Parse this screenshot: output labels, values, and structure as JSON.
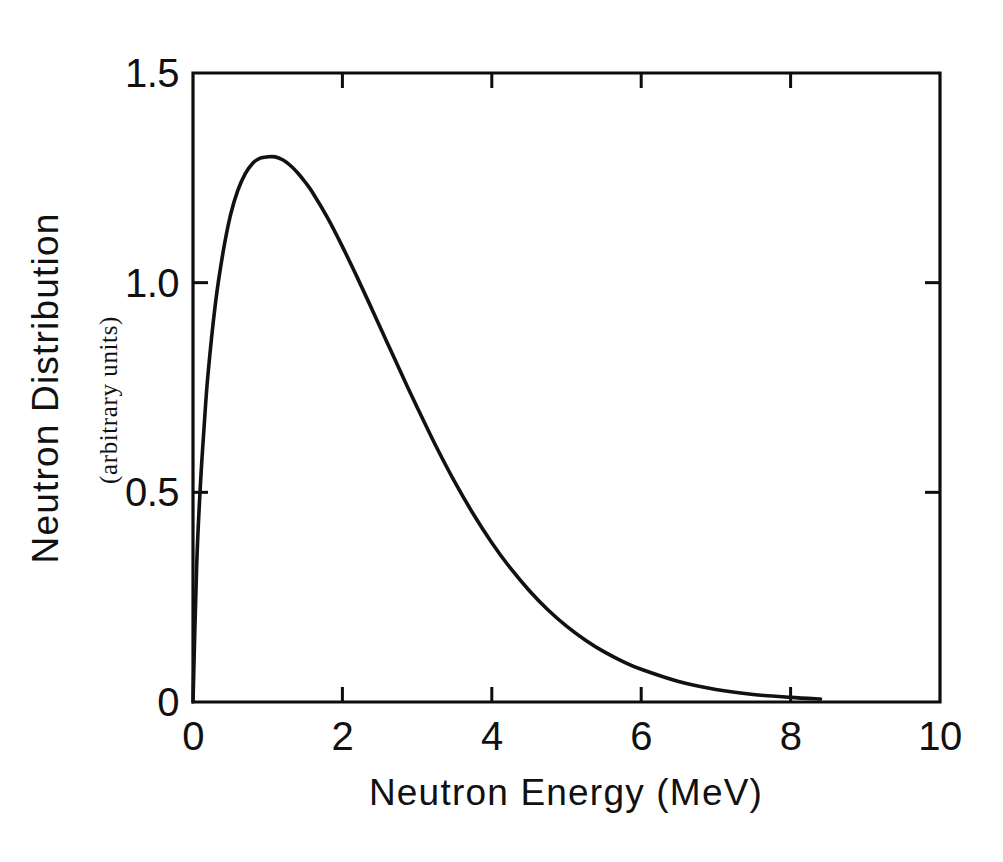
{
  "figure": {
    "background_color": "#ffffff",
    "ink_color": "#111111"
  },
  "chart_data": {
    "type": "line",
    "title": "",
    "xlabel": "Neutron Energy (MeV)",
    "ylabel": "Neutron Distribution",
    "ylabel_subtitle": "(arbitrary units)",
    "xlim": [
      0,
      10
    ],
    "ylim": [
      0,
      1.5
    ],
    "grid": false,
    "legend": null,
    "x_ticks": [
      0,
      2,
      4,
      6,
      8,
      10
    ],
    "x_tick_labels": [
      "0",
      "2",
      "4",
      "6",
      "8",
      "10"
    ],
    "y_ticks": [
      0,
      0.5,
      1.0,
      1.5
    ],
    "y_tick_labels": [
      "0",
      "0.5",
      "1.0",
      "1.5"
    ],
    "tick_direction": "in",
    "ticks_on_all_sides": true,
    "peak": {
      "x": 1.1,
      "y": 1.3
    },
    "series": [
      {
        "name": "Neutron distribution",
        "x": [
          0.0,
          0.05,
          0.1,
          0.15,
          0.2,
          0.3,
          0.4,
          0.5,
          0.6,
          0.7,
          0.8,
          0.9,
          1.0,
          1.1,
          1.2,
          1.3,
          1.4,
          1.5,
          1.6,
          1.8,
          2.0,
          2.2,
          2.4,
          2.6,
          2.8,
          3.0,
          3.25,
          3.5,
          3.75,
          4.0,
          4.25,
          4.5,
          4.75,
          5.0,
          5.25,
          5.5,
          5.75,
          6.0,
          6.5,
          7.0,
          7.5,
          8.0,
          8.4
        ],
        "y": [
          0.0,
          0.33,
          0.52,
          0.66,
          0.78,
          0.95,
          1.07,
          1.16,
          1.22,
          1.26,
          1.285,
          1.297,
          1.3,
          1.3,
          1.293,
          1.28,
          1.262,
          1.24,
          1.215,
          1.155,
          1.086,
          1.012,
          0.935,
          0.857,
          0.779,
          0.703,
          0.611,
          0.526,
          0.449,
          0.38,
          0.319,
          0.266,
          0.22,
          0.181,
          0.148,
          0.12,
          0.097,
          0.078,
          0.049,
          0.03,
          0.018,
          0.011,
          0.007
        ]
      }
    ]
  }
}
